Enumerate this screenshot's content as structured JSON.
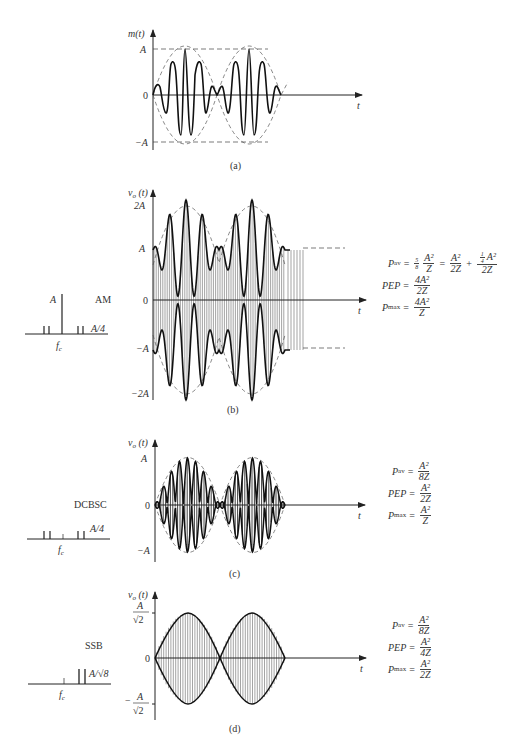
{
  "figure": {
    "panels": [
      {
        "id": "a",
        "caption": "(a)",
        "y_axis_label": "m(t)",
        "x_axis_label": "t",
        "ticks": [
          "A",
          "0",
          "−A"
        ]
      },
      {
        "id": "b",
        "caption": "(b)",
        "y_axis_label": "v_o (t)",
        "x_axis_label": "t",
        "ticks": [
          "2A",
          "A",
          "0",
          "−A",
          "−2A"
        ],
        "modulation": "AM",
        "spectrum": {
          "carrier_label": "A",
          "sideband_label": "A/4",
          "freq_label": "f_c"
        },
        "equations": {
          "p_av": {
            "lhs": "P",
            "sub": "av",
            "coef_num": "5",
            "coef_den": "8",
            "t1_num": "A²",
            "t1_den": "Z",
            "t2_num": "A²",
            "t2_den": "2Z",
            "t3_coef_num": "1",
            "t3_coef_den": "4",
            "t3_num": "A²",
            "t3_den": "2Z"
          },
          "pep": {
            "lhs": "PEP",
            "num": "4A²",
            "den": "2Z"
          },
          "p_max": {
            "lhs": "P",
            "sub": "max",
            "num": "4A²",
            "den": "Z"
          }
        }
      },
      {
        "id": "c",
        "caption": "(c)",
        "y_axis_label": "v_o (t)",
        "x_axis_label": "t",
        "ticks": [
          "A",
          "0",
          "−A"
        ],
        "modulation": "DCBSC",
        "spectrum": {
          "sideband_label": "A/4",
          "freq_label": "f_c"
        },
        "equations": {
          "p_av": {
            "lhs": "P",
            "sub": "av",
            "num": "A²",
            "den": "8Z"
          },
          "pep": {
            "lhs": "PEP",
            "num": "A²",
            "den": "2Z"
          },
          "p_max": {
            "lhs": "P",
            "sub": "max",
            "num": "A²",
            "den": "Z"
          }
        }
      },
      {
        "id": "d",
        "caption": "(d)",
        "y_axis_label": "v_o (t)",
        "x_axis_label": "t",
        "ticks": [
          "A/√2",
          "0",
          "−A/√2"
        ],
        "tick_top_num": "A",
        "tick_top_den": "√2",
        "tick_bot_num": "A",
        "tick_bot_den": "√2",
        "modulation": "SSB",
        "spectrum": {
          "sideband_label": "A/√8",
          "freq_label": "f_c"
        },
        "equations": {
          "p_av": {
            "lhs": "P",
            "sub": "av",
            "num": "A²",
            "den": "8Z"
          },
          "pep": {
            "lhs": "PEP",
            "num": "A²",
            "den": "4Z"
          },
          "p_max": {
            "lhs": "P",
            "sub": "max",
            "num": "A²",
            "den": "2Z"
          }
        }
      }
    ]
  },
  "labels": {
    "m_t": "m(t)",
    "v_o": "v",
    "v_o_sub": "o",
    "v_o_arg": " (t)",
    "t": "t",
    "A": "A",
    "zero": "0",
    "minusA": "−A",
    "twoA": "2A",
    "minusTwoA": "−2A",
    "minus": "−",
    "fc": "f",
    "fc_sub": "c"
  }
}
